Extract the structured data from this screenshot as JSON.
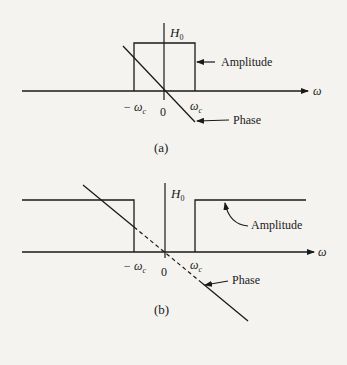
{
  "figure_a": {
    "caption": "(a)",
    "y_axis_label": "H",
    "y_axis_label_sub": "0",
    "x_axis_label": "ω",
    "tick_neg": "− ω",
    "tick_neg_sub": "c",
    "tick_zero": "0",
    "tick_pos": "ω",
    "tick_pos_sub": "c",
    "amplitude_label": "Amplitude",
    "phase_label": "Phase",
    "filter_type": "lowpass"
  },
  "figure_b": {
    "caption": "(b)",
    "y_axis_label": "H",
    "y_axis_label_sub": "0",
    "x_axis_label": "ω",
    "tick_neg": "− ω",
    "tick_neg_sub": "c",
    "tick_zero": "0",
    "tick_pos": "ω",
    "tick_pos_sub": "c",
    "amplitude_label": "Amplitude",
    "phase_label": "Phase",
    "filter_type": "highpass"
  },
  "colors": {
    "ink": "#1a1a1a",
    "paper": "#f4f3f0",
    "bleed": "#d6d4cf"
  }
}
